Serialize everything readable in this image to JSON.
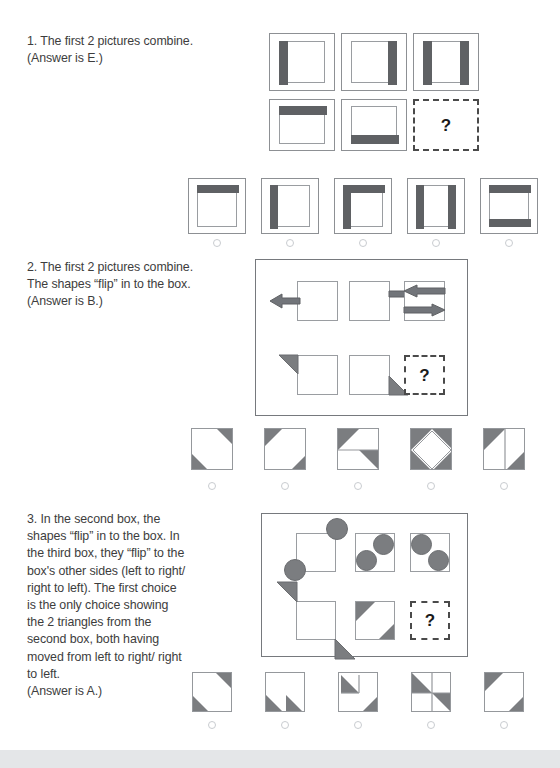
{
  "document": {
    "type": "worksheet",
    "title": "Non-verbal reasoning practice — matrix puzzles",
    "page_background": "#ffffff",
    "shape_fill": "#5f6164",
    "shape_outline": "#9a9da1"
  },
  "puzzles": [
    {
      "number": "1",
      "text": "1. The first 2 pictures combine.\n(Answer is E.)",
      "answer": "E",
      "matrix": {
        "rows": 2,
        "cols": 3,
        "cells": [
          {
            "id": "r1c1",
            "description": "framed square with dark bar on left edge"
          },
          {
            "id": "r1c2",
            "description": "framed square with dark bar on right edge"
          },
          {
            "id": "r1c3",
            "description": "framed square with dark bars on left and right edges"
          },
          {
            "id": "r2c1",
            "description": "framed square with dark bar on top edge"
          },
          {
            "id": "r2c2",
            "description": "framed square with dark bar on bottom edge"
          },
          {
            "id": "r2c3",
            "description": "missing cell",
            "is_question": true,
            "label": "?"
          }
        ]
      },
      "choices": [
        {
          "letter": "A",
          "description": "framed square with dark bar on top edge"
        },
        {
          "letter": "B",
          "description": "framed square with dark bar on left edge"
        },
        {
          "letter": "C",
          "description": "framed square with dark bars on top and left edges"
        },
        {
          "letter": "D",
          "description": "framed square with dark bars on left and right edges"
        },
        {
          "letter": "E",
          "description": "framed square with dark bars on top and bottom edges"
        }
      ]
    },
    {
      "number": "2",
      "text": "2. The first 2 pictures combine.\nThe shapes “flip” in to the box.\n(Answer is B.)",
      "answer": "B",
      "matrix": {
        "rows": 2,
        "cols": 3,
        "cells": [
          {
            "id": "r1c1",
            "description": "square with arrow pointing left outside left edge"
          },
          {
            "id": "r1c2",
            "description": "square with arrow pointing right outside right edge"
          },
          {
            "id": "r1c3",
            "description": "square containing arrow pointing left above arrow pointing right"
          },
          {
            "id": "r2c1",
            "description": "square with shaded triangle outside top-left corner"
          },
          {
            "id": "r2c2",
            "description": "square with shaded triangle outside bottom-right corner"
          },
          {
            "id": "r2c3",
            "description": "missing cell",
            "is_question": true,
            "label": "?"
          }
        ]
      },
      "choices": [
        {
          "letter": "A",
          "description": "square with shaded triangles at top-right and bottom-left corners"
        },
        {
          "letter": "B",
          "description": "square with shaded triangles at top-left and bottom-right corners"
        },
        {
          "letter": "C",
          "description": "square split horizontally with shaded triangles top-left and middle-right"
        },
        {
          "letter": "D",
          "description": "square with shaded triangles in all four corners forming a white diamond"
        },
        {
          "letter": "E",
          "description": "square split vertically with shaded triangles top-left and bottom-right"
        }
      ]
    },
    {
      "number": "3",
      "text": "3. In the second box, the shapes “flip” in to the box. In the third box, they “flip” to the box's other sides (left to right/ right to left). The first choice is the only choice showing the 2 triangles from the second box, both having moved from left to right/ right to left.\n(Answer is A.)",
      "answer": "A",
      "matrix": {
        "rows": 2,
        "cols": 3,
        "cells": [
          {
            "id": "r1c1",
            "description": "square with circles outside top-right and bottom-left corners"
          },
          {
            "id": "r1c2",
            "description": "square with circles inside top-right and bottom-left corners"
          },
          {
            "id": "r1c3",
            "description": "square with circles inside top-left and bottom-right corners"
          },
          {
            "id": "r2c1",
            "description": "square with shaded triangles outside top-left and bottom-right corners"
          },
          {
            "id": "r2c2",
            "description": "square with shaded triangles inside top-left and bottom-right corners"
          },
          {
            "id": "r2c3",
            "description": "missing cell",
            "is_question": true,
            "label": "?"
          }
        ]
      },
      "choices": [
        {
          "letter": "A",
          "description": "square with shaded triangles inside top-right and bottom-left corners"
        },
        {
          "letter": "B",
          "description": "square with two shaded triangles along the bottom edge"
        },
        {
          "letter": "C",
          "description": "square with shaded triangle upper-left quadrant and lower-right corner"
        },
        {
          "letter": "D",
          "description": "square with shaded triangles in upper-left and lower-right quadrants"
        },
        {
          "letter": "E",
          "description": "square with shaded triangles at top-left and bottom-right corners"
        }
      ]
    }
  ]
}
